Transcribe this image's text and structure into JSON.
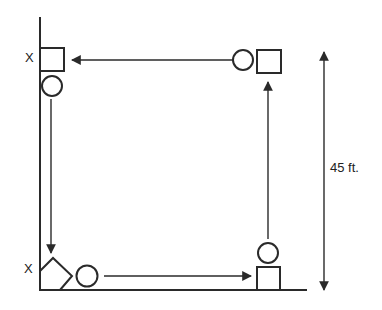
{
  "diagram": {
    "labels": {
      "top_left_marker": "X",
      "bottom_left_marker": "X",
      "dimension": "45 ft."
    },
    "colors": {
      "stroke": "#2a2a2a",
      "background": "#ffffff"
    },
    "nodes": [
      {
        "id": "top-left-square",
        "shape": "square"
      },
      {
        "id": "top-left-circle",
        "shape": "circle"
      },
      {
        "id": "top-right-circle",
        "shape": "circle"
      },
      {
        "id": "top-right-square",
        "shape": "square"
      },
      {
        "id": "bottom-left-diamond",
        "shape": "diamond"
      },
      {
        "id": "bottom-left-circle",
        "shape": "circle"
      },
      {
        "id": "bottom-right-circle",
        "shape": "circle"
      },
      {
        "id": "bottom-right-square",
        "shape": "square"
      }
    ],
    "arrows": [
      {
        "from": "top-right-circle",
        "to": "top-left-square",
        "direction": "left"
      },
      {
        "from": "top-left-circle",
        "to": "bottom-left-diamond",
        "direction": "down"
      },
      {
        "from": "bottom-left-circle",
        "to": "bottom-right-square",
        "direction": "right"
      },
      {
        "from": "bottom-right-circle",
        "to": "top-right-square",
        "direction": "up"
      }
    ]
  }
}
